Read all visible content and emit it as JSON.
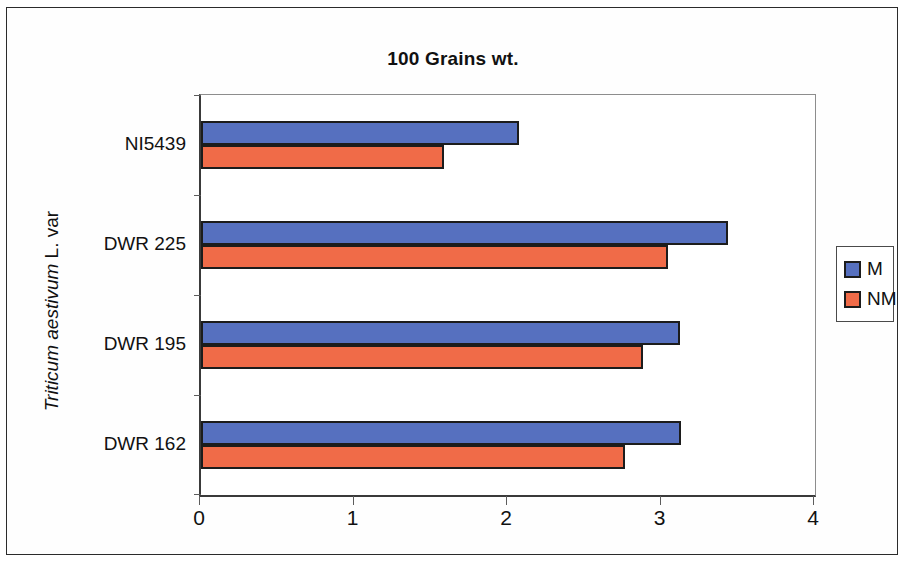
{
  "chart_data": {
    "type": "bar",
    "orientation": "horizontal",
    "title": "100 Grains wt.",
    "xlabel": "",
    "ylabel": "Triticum aestivum L. var",
    "ylabel_italic_part": "Triticum aestivum",
    "ylabel_roman_part": " L. var",
    "categories": [
      "DWR 162",
      "DWR 195",
      "DWR 225",
      "NI5439"
    ],
    "categories_top_to_bottom": [
      "NI5439",
      "DWR 225",
      "DWR 195",
      "DWR 162"
    ],
    "series": [
      {
        "name": "M",
        "color": "#5670bf",
        "values": [
          3.13,
          3.12,
          3.43,
          2.07
        ]
      },
      {
        "name": "NM",
        "color": "#f06b48",
        "values": [
          2.76,
          2.88,
          3.04,
          1.58
        ]
      }
    ],
    "xlim": [
      0,
      4
    ],
    "xticks": [
      0,
      1,
      2,
      3,
      4
    ],
    "xtick_labels": [
      "0",
      "1",
      "2",
      "3",
      "4"
    ],
    "grid": false,
    "legend_position": "right"
  },
  "legend": {
    "entries": [
      {
        "label": "M",
        "color": "#5670bf"
      },
      {
        "label": "NM",
        "color": "#f06b48"
      }
    ]
  },
  "axis": {
    "x_tick_labels": [
      "0",
      "1",
      "2",
      "3",
      "4"
    ],
    "y_tick_labels": [
      "NI5439",
      "DWR 225",
      "DWR 195",
      "DWR 162"
    ]
  }
}
